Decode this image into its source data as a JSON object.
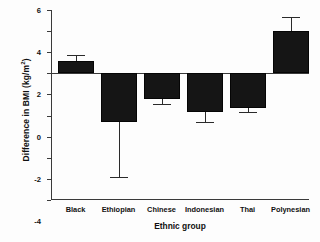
{
  "chart_data": {
    "type": "bar",
    "title": "",
    "xlabel": "Ethnic group",
    "ylabel": "Difference in BMI (kg/m²)",
    "ylabel_main": "Difference in BMI (kg/m",
    "ylabel_sup": "2",
    "ylabel_tail": ")",
    "categories": [
      "Black",
      "Ethiopian",
      "Chinese",
      "Indonesian",
      "Thai",
      "Polynesian"
    ],
    "values": [
      1.2,
      -4.6,
      -2.4,
      -3.7,
      -3.3,
      4.0
    ],
    "error_high": [
      1.7,
      -4.6,
      -2.4,
      -3.7,
      -3.3,
      5.3
    ],
    "error_low": [
      1.2,
      -9.8,
      -2.9,
      -4.6,
      -3.7,
      4.0
    ],
    "ylim": [
      -12,
      6
    ],
    "yticks": [
      6,
      4,
      2,
      0,
      -2,
      -4,
      -6,
      -8,
      -10,
      -12
    ],
    "ytick_labels": [
      "6",
      "4",
      "2",
      "0",
      "-2",
      "-4",
      "-6",
      "-8",
      "-10",
      "-12"
    ],
    "grid": false,
    "legend": null,
    "bar_color": "#151515",
    "axis_color": "#3a3a3a",
    "background": "#ffffff"
  }
}
